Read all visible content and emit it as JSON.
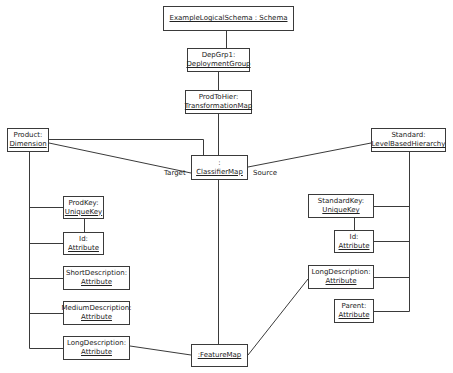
{
  "diagram": {
    "nodes": [
      {
        "id": "schema",
        "name": "",
        "type": "ExampleLogicalSchema : Schema"
      },
      {
        "id": "depgrp",
        "name": "DepGrp1:",
        "type": "DeploymentGroup"
      },
      {
        "id": "prodtohier",
        "name": "ProdToHier:",
        "type": "TransformationMap"
      },
      {
        "id": "classifiermap",
        "name": ":",
        "type": "ClassifierMap"
      },
      {
        "id": "product",
        "name": "Product:",
        "type": "Dimension"
      },
      {
        "id": "standard",
        "name": "Standard:",
        "type": "LevelBasedHierarchy"
      },
      {
        "id": "prodkey",
        "name": "ProdKey:",
        "type": "UniqueKey"
      },
      {
        "id": "prod-id",
        "name": "Id:",
        "type": "Attribute"
      },
      {
        "id": "shortdesc",
        "name": "ShortDescription:",
        "type": "Attribute"
      },
      {
        "id": "mediumdesc",
        "name": "MediumDescription:",
        "type": "Attribute"
      },
      {
        "id": "prod-longdesc",
        "name": "LongDescription:",
        "type": "Attribute"
      },
      {
        "id": "featuremap",
        "name": "",
        "type": ":FeatureMap"
      },
      {
        "id": "standardkey",
        "name": "StandardKey:",
        "type": "UniqueKey"
      },
      {
        "id": "std-id",
        "name": "Id:",
        "type": "Attribute"
      },
      {
        "id": "std-longdesc",
        "name": "LongDescription:",
        "type": "Attribute"
      },
      {
        "id": "parent",
        "name": "Parent:",
        "type": "Attribute"
      }
    ],
    "roles": {
      "target": "Target",
      "source": "Source"
    },
    "edges": [
      {
        "from": "schema",
        "to": "depgrp"
      },
      {
        "from": "depgrp",
        "to": "prodtohier"
      },
      {
        "from": "prodtohier",
        "to": "classifiermap"
      },
      {
        "from": "product",
        "to": "classifiermap"
      },
      {
        "from": "product",
        "to": "classifiermap",
        "role": "Target"
      },
      {
        "from": "classifiermap",
        "to": "standard",
        "role": "Source"
      },
      {
        "from": "classifiermap",
        "to": "featuremap"
      },
      {
        "from": "product",
        "to": "prodkey"
      },
      {
        "from": "product",
        "to": "prod-id"
      },
      {
        "from": "product",
        "to": "shortdesc"
      },
      {
        "from": "product",
        "to": "mediumdesc"
      },
      {
        "from": "product",
        "to": "prod-longdesc"
      },
      {
        "from": "prodkey",
        "to": "prod-id"
      },
      {
        "from": "standard",
        "to": "standardkey"
      },
      {
        "from": "standard",
        "to": "std-id"
      },
      {
        "from": "standard",
        "to": "std-longdesc"
      },
      {
        "from": "standard",
        "to": "parent"
      },
      {
        "from": "standardkey",
        "to": "std-id"
      },
      {
        "from": "prod-longdesc",
        "to": "featuremap"
      },
      {
        "from": "featuremap",
        "to": "std-longdesc"
      }
    ],
    "colors": {
      "line": "#3a3a3a",
      "background": "#ffffff",
      "text": "#222222"
    }
  }
}
